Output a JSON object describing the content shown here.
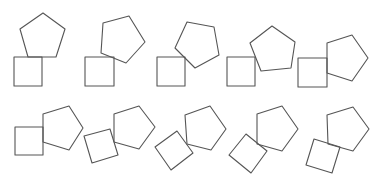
{
  "figure": {
    "stroke_color": "#555555",
    "background": "#ffffff",
    "panels": [
      {
        "id": 1,
        "square": "14,57 42,57 42,86 14,86",
        "pentagon": "43,13 65,29 56,57 28,57 20,29"
      },
      {
        "id": 2,
        "square": "85,57 114,57 114,86 85,86",
        "pentagon": "103,23 129,16 145,42 126,63 101,53"
      },
      {
        "id": 3,
        "square": "157,57 185,57 185,86 157,86",
        "pentagon": "187,22 214,27 219,55 195,68 175,48"
      },
      {
        "id": 4,
        "square": "227,57 255,57 255,86 227,86",
        "pentagon": "272,26 295,42 291,68 261,71 250,43"
      },
      {
        "id": 5,
        "square": "298,58 327,58 327,87 298,87",
        "pentagon": "327,43 352,35 368,58 352,81 327,73"
      },
      {
        "id": 6,
        "square": "15,127 43,127 43,155 15,155",
        "pentagon": "43,114 69,106 83,128 69,150 43,142"
      },
      {
        "id": 7,
        "square": "84,136 110,129 118,155 92,163",
        "pentagon": "114,114 139,106 155,127 139,149 114,142"
      },
      {
        "id": 8,
        "square": "155,147 177,131 193,153 171,170",
        "pentagon": "185,115 210,106 226,129 211,150 187,144"
      },
      {
        "id": 9,
        "square": "229,155 246,134 267,151 251,173",
        "pentagon": "257,114 282,106 298,129 282,151 257,144"
      },
      {
        "id": 10,
        "square": "314,139 340,147 332,173 306,165",
        "pentagon": "327,115 353,107 369,129 353,151 328,144"
      }
    ]
  }
}
